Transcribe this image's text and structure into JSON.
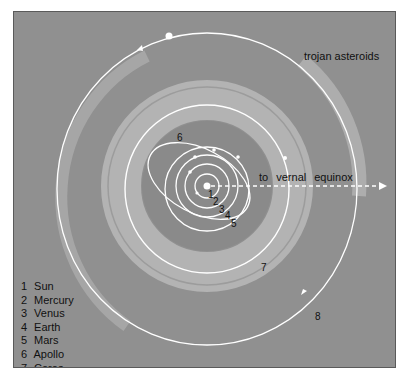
{
  "diagram": {
    "title_labels": {
      "trojan": "trojan asteroids",
      "vernal": "to vernal equinox"
    },
    "orbit_numbers": [
      "1",
      "2",
      "3",
      "4",
      "5",
      "6",
      "7",
      "8"
    ],
    "legend": [
      {
        "num": "1",
        "name": "Sun"
      },
      {
        "num": "2",
        "name": "Mercury"
      },
      {
        "num": "3",
        "name": "Venus"
      },
      {
        "num": "4",
        "name": "Earth"
      },
      {
        "num": "5",
        "name": "Mars"
      },
      {
        "num": "6",
        "name": "Apollo"
      },
      {
        "num": "7",
        "name": "Ceres"
      },
      {
        "num": "8",
        "name": "Jupiter"
      }
    ],
    "colors": {
      "background": "#909090",
      "belt": "#b3b3b3",
      "orbit": "#ffffff",
      "text": "#111111"
    }
  }
}
